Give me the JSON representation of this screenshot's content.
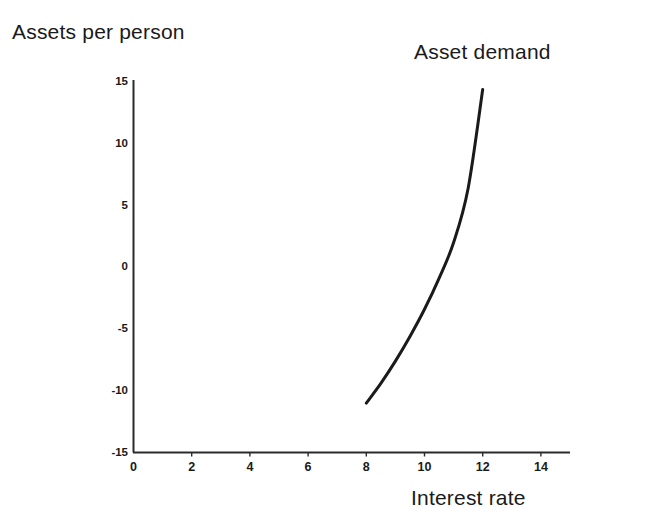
{
  "chart_data": {
    "type": "line",
    "title": "",
    "ylabel": "Assets per person",
    "xlabel": "Interest rate",
    "xlim": [
      0,
      15
    ],
    "ylim": [
      -15,
      15
    ],
    "grid": false,
    "legend_position": "inline-annotation",
    "xticks": [
      "0",
      "2",
      "4",
      "6",
      "8",
      "10",
      "12",
      "14"
    ],
    "xtick_values": [
      0,
      2,
      4,
      6,
      8,
      10,
      12,
      14
    ],
    "yticks": [
      "15",
      "10",
      "5",
      "0",
      "-5",
      "-10",
      "-15"
    ],
    "ytick_values": [
      15,
      10,
      5,
      0,
      -5,
      -10,
      -15
    ],
    "series": [
      {
        "name": "Asset demand",
        "annotation": "Asset demand",
        "color": "#1a1a1a",
        "x": [
          8.0,
          8.5,
          9.0,
          9.5,
          10.0,
          10.5,
          11.0,
          11.5,
          12.0
        ],
        "values": [
          -11.0,
          -9.4,
          -7.6,
          -5.6,
          -3.4,
          -0.9,
          2.0,
          6.4,
          14.4
        ]
      }
    ]
  },
  "axes": {
    "y_axis_title": "Assets per person",
    "x_axis_title": "Interest rate",
    "series_annotation": "Asset demand"
  },
  "colors": {
    "background": "#ffffff",
    "ink": "#1a1a1a",
    "axis": "#2b2b2b",
    "curve": "#1a1a1a"
  }
}
